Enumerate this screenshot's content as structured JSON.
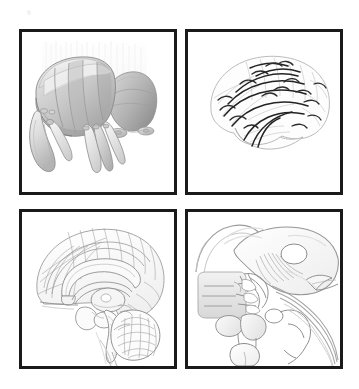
{
  "figure": {
    "background_color": "#ffffff",
    "frame_color": "#1a1a1a",
    "layout": "2x2 grid of framed anatomical illustrations",
    "width": 359,
    "height": 389
  },
  "palette": {
    "ink_dark": "#1a1a1a",
    "ink_tract": "#2b2b2b",
    "line_gray": "#9a9a9a",
    "line_light": "#c3c3c3",
    "fill_light": "#e6e6e6",
    "fill_mid": "#cfcfcf",
    "fill_dark": "#ababab",
    "fill_shadow": "#8f8f8f",
    "paper": "#ffffff"
  },
  "panels": [
    {
      "id": "panel-top-left",
      "position": "top-left",
      "style": "shaded three-dimensional rendering",
      "subject": "Basal ganglia and thalamus with brainstem, oblique three-quarter view",
      "rendering": "grayscale airbrushed volume shading with segmented lamellae",
      "elements": [
        "caudate nucleus body",
        "putamen with segmented striations",
        "globus pallidus",
        "thalamus lateral mass",
        "amygdala",
        "caudate tail hook",
        "descending fiber columns",
        "midbrain footplate"
      ]
    },
    {
      "id": "panel-top-right",
      "position": "top-right",
      "style": "line drawing with dark fiber overlay",
      "subject": "Lateral cerebral hemisphere showing association fiber tracts",
      "rendering": "pale gray gyral outlines with heavy black arcuate fiber bundles",
      "elements": [
        "frontal lobe",
        "parietal lobe",
        "occipital lobe",
        "temporal lobe",
        "sylvian fissure",
        "superior longitudinal fasciculus",
        "arcuate fasciculus",
        "uncinate fasciculus",
        "short arcuate U-fibers"
      ]
    },
    {
      "id": "panel-bottom-left",
      "position": "bottom-left",
      "style": "fine line drawing with light shading",
      "subject": "Mid-sagittal section of the brain",
      "rendering": "contour line drawing with subtle gray wash",
      "elements": [
        "medial cortical surface with gyri and sulci",
        "corpus callosum",
        "fornix",
        "thalamus",
        "midbrain",
        "pons",
        "medulla oblongata",
        "cerebellum with arbor vitae folia",
        "cerebral aqueduct",
        "spinal cord"
      ]
    },
    {
      "id": "panel-bottom-right",
      "position": "bottom-right",
      "style": "magnified line drawing",
      "subject": "Hypothalamic and pituitary region, sagittal close-up",
      "rendering": "open contour lines with soft gradient shading",
      "elements": [
        "corpus callosum rostrum",
        "septum pellucidum block",
        "third ventricle",
        "thalamus",
        "hypothalamic nuclei with fiber striations",
        "optic chiasm",
        "infundibulum",
        "pituitary gland",
        "mammillary body",
        "midbrain tegmentum",
        "cerebral peduncle"
      ]
    }
  ],
  "marks": {
    "speck_note": "faint light gray speck near upper left of sheet"
  }
}
